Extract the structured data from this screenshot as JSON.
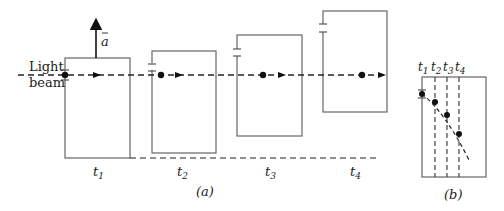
{
  "figure": {
    "beam_label_line1": "Light",
    "beam_label_line2": "beam",
    "accel_label": "a",
    "panel_a_caption": "(a)",
    "panel_b_caption": "(b)",
    "time_labels": [
      {
        "t": "t",
        "sub": "1"
      },
      {
        "t": "t",
        "sub": "2"
      },
      {
        "t": "t",
        "sub": "3"
      },
      {
        "t": "t",
        "sub": "4"
      }
    ],
    "colors": {
      "line": "#555555",
      "dark": "#111111"
    }
  }
}
